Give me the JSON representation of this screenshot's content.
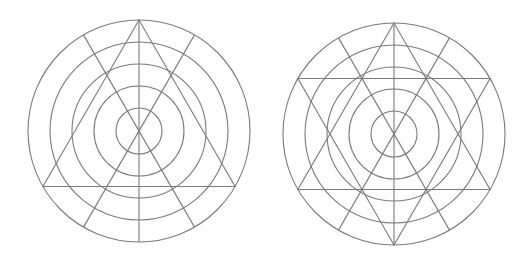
{
  "canvas": {
    "width": 524,
    "height": 264,
    "background": "#ffffff"
  },
  "style": {
    "stroke": "#7a7a7a",
    "stroke_width": 1.1
  },
  "diagrams": [
    {
      "name": "concentric-rings-with-triangle",
      "center": [
        139,
        131
      ],
      "ring_radii": [
        23,
        45,
        67,
        89,
        111
      ],
      "spoke_angles_deg": [
        90,
        60,
        120
      ],
      "triangles": [
        {
          "name": "upward-triangle",
          "vertex_angles_deg": [
            90,
            210,
            330
          ]
        }
      ]
    },
    {
      "name": "concentric-rings-with-hexagram",
      "center": [
        394,
        134
      ],
      "ring_radii": [
        23,
        45,
        67,
        89,
        111
      ],
      "spoke_angles_deg": [
        90,
        60,
        120
      ],
      "triangles": [
        {
          "name": "upward-triangle",
          "vertex_angles_deg": [
            90,
            210,
            330
          ]
        },
        {
          "name": "downward-triangle",
          "vertex_angles_deg": [
            270,
            30,
            150
          ]
        }
      ]
    }
  ]
}
